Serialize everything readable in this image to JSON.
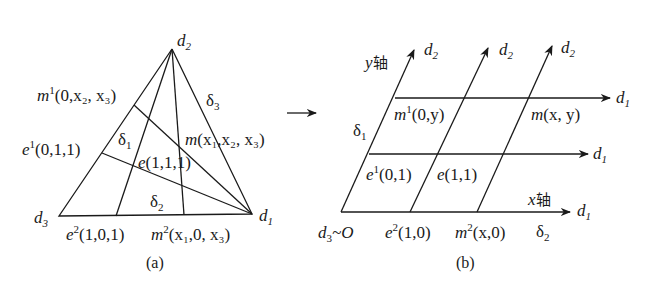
{
  "figure_a": {
    "caption": "(a)",
    "vertices": {
      "d1": {
        "base": "d",
        "sub": "1"
      },
      "d2": {
        "base": "d",
        "sub": "2"
      },
      "d3": {
        "base": "d",
        "sub": "3"
      }
    },
    "edge_labels": {
      "delta1": {
        "base": "δ",
        "sub": "1"
      },
      "delta2": {
        "base": "δ",
        "sub": "2"
      },
      "delta3": {
        "base": "δ",
        "sub": "3"
      }
    },
    "points": {
      "m1": {
        "base": "m",
        "sup": "1",
        "args": "(0,x₂, x₃)"
      },
      "e1": {
        "base": "e",
        "sup": "1",
        "args": "(0,1,1)"
      },
      "m": {
        "base": "m",
        "args": "(x₁,x₂, x₃)"
      },
      "e": {
        "base": "e",
        "args": "(1,1,1)"
      },
      "e2": {
        "base": "e",
        "sup": "2",
        "args": "(1,0,1)"
      },
      "m2": {
        "base": "m",
        "sup": "2",
        "args": "(x₁,0, x₃)"
      }
    }
  },
  "arrow_symbol": "→",
  "figure_b": {
    "caption": "(b)",
    "axes": {
      "y_axis_label": {
        "var": "y",
        "text": "轴"
      },
      "x_axis_label": {
        "var": "x",
        "text": "轴"
      }
    },
    "origin_label": {
      "base": "d",
      "sub": "3",
      "rest": "~O"
    },
    "arrow_ends": {
      "d2": {
        "base": "d",
        "sub": "2"
      },
      "d1": {
        "base": "d",
        "sub": "1"
      }
    },
    "edge_labels": {
      "delta1": {
        "base": "δ",
        "sub": "1"
      },
      "delta2": {
        "base": "δ",
        "sub": "2"
      }
    },
    "points": {
      "m1": {
        "base": "m",
        "sup": "1",
        "args": "(0,y)"
      },
      "m": {
        "base": "m",
        "args": "(x, y)"
      },
      "e1": {
        "base": "e",
        "sup": "1",
        "args": "(0,1)"
      },
      "e": {
        "base": "e",
        "args": "(1,1)"
      },
      "e2": {
        "base": "e",
        "sup": "2",
        "args": "(1,0)"
      },
      "m2": {
        "base": "m",
        "sup": "2",
        "args": "(x,0)"
      }
    }
  }
}
